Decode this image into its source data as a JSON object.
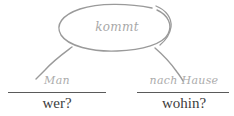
{
  "diagram": {
    "type": "sentence-constituent-diagram",
    "language": "German",
    "sentence": "Man kommt nach Hause",
    "stroke_color": "#9a9a9a",
    "phrase_text_color": "#ababab",
    "question_text_color": "#3d3d3d",
    "background_color": "#ffffff"
  },
  "verb_node": {
    "label": "kommt",
    "shape": "ellipse"
  },
  "branches": [
    {
      "phrase": "Man",
      "question": "wer?"
    },
    {
      "phrase": "nach Hause",
      "question": "wohin?"
    }
  ]
}
